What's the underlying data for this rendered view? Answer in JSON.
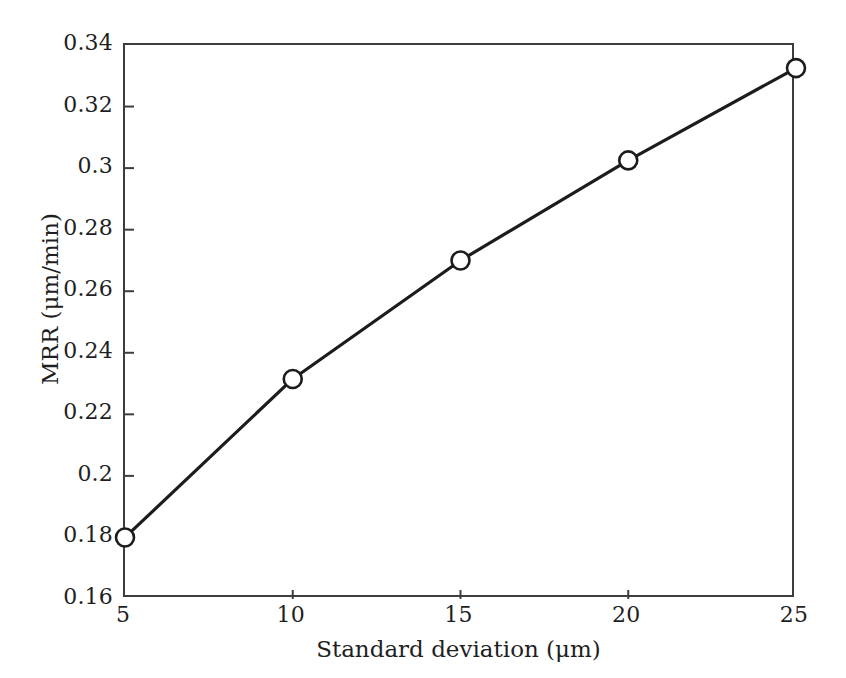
{
  "chart_data": {
    "type": "line",
    "title": "",
    "subtitle": "",
    "xlabel": "Standard deviation (μm)",
    "ylabel": "MRR (μm/min)",
    "x": [
      5,
      10,
      15,
      20,
      25
    ],
    "values": [
      0.18,
      0.2315,
      0.27,
      0.3025,
      0.3325
    ],
    "series": [
      {
        "name": "MRR",
        "x": [
          5,
          10,
          15,
          20,
          25
        ],
        "values": [
          0.18,
          0.2315,
          0.27,
          0.3025,
          0.3325
        ]
      }
    ],
    "xlim": [
      5,
      25
    ],
    "ylim": [
      0.16,
      0.34
    ],
    "xticks": [
      5,
      10,
      15,
      20,
      25
    ],
    "yticks": [
      0.16,
      0.18,
      0.2,
      0.22,
      0.24,
      0.26,
      0.28,
      0.3,
      0.32,
      0.34
    ],
    "xtick_labels": [
      "5",
      "10",
      "15",
      "20",
      "25"
    ],
    "ytick_labels": [
      "0.16",
      "0.18",
      "0.2",
      "0.22",
      "0.24",
      "0.26",
      "0.28",
      "0.3",
      "0.32",
      "0.34"
    ],
    "grid": false,
    "legend": null,
    "legend_position": "none",
    "annotations": [],
    "marker_style": "open-circle",
    "line_color": "#1c1c1c",
    "marker_face_color": "#ffffff",
    "marker_edge_color": "#1c1c1c",
    "axis_color": "#3d3d3d",
    "background_color": "#ffffff"
  }
}
